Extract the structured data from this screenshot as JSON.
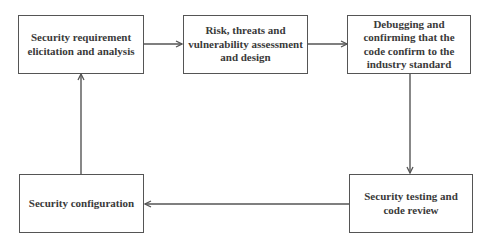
{
  "diagram": {
    "type": "flowchart-cycle",
    "colors": {
      "stroke": "#555555",
      "text": "#3a3a3a",
      "background": "#ffffff"
    },
    "nodes": [
      {
        "id": "n1",
        "label": "Security requirement elicitation and analysis"
      },
      {
        "id": "n2",
        "label": "Risk, threats and vulnerability assessment and design"
      },
      {
        "id": "n3",
        "label": "Debugging and confirming that the code confirm to the industry standard"
      },
      {
        "id": "n4",
        "label": "Security testing and code review"
      },
      {
        "id": "n5",
        "label": "Security configuration"
      }
    ],
    "edges": [
      {
        "from": "n1",
        "to": "n2"
      },
      {
        "from": "n2",
        "to": "n3"
      },
      {
        "from": "n3",
        "to": "n4"
      },
      {
        "from": "n4",
        "to": "n5"
      },
      {
        "from": "n5",
        "to": "n1"
      }
    ]
  }
}
